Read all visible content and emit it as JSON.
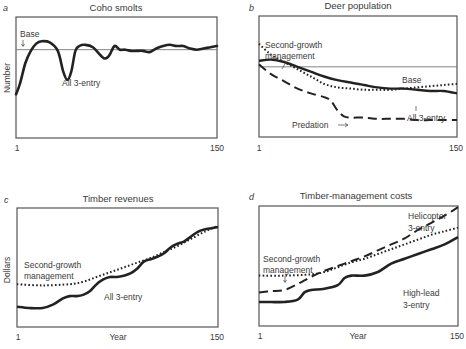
{
  "chart_data": [
    {
      "panel": "a",
      "type": "line",
      "title": "Coho smolts",
      "xlabel": "",
      "ylabel": "Number",
      "xlim": [
        1,
        150
      ],
      "x_ticks": [
        "1",
        "150"
      ],
      "frame": {
        "x0": 16,
        "y0": 17,
        "x1": 217,
        "y1": 138
      },
      "reference": {
        "name": "Base",
        "value": 73
      },
      "series": [
        {
          "name": "All 3-entry",
          "style": "solid",
          "x": [
            1,
            4,
            8,
            12,
            16,
            20,
            26,
            32,
            36,
            39,
            42,
            45,
            48,
            52,
            58,
            66,
            70,
            74,
            78,
            82,
            86,
            90,
            95,
            100,
            105,
            110,
            115,
            120,
            125,
            130,
            135,
            140,
            145,
            150
          ],
          "y": [
            36,
            45,
            62,
            72,
            78,
            80,
            79,
            72,
            55,
            48,
            55,
            72,
            76,
            77,
            75,
            66,
            68,
            76,
            73,
            73,
            72,
            72,
            72,
            71,
            74,
            76,
            77,
            76,
            76,
            74,
            73,
            74,
            75,
            76
          ]
        }
      ],
      "annotations": [
        {
          "text": "Base",
          "x": 18,
          "y": 37
        },
        {
          "text": "All 3-entry",
          "x": 62,
          "y": 85
        }
      ]
    },
    {
      "panel": "b",
      "type": "line",
      "title": "Deer population",
      "xlabel": "",
      "ylabel": "",
      "xlim": [
        1,
        150
      ],
      "x_ticks": [
        "1",
        "150"
      ],
      "frame": {
        "x0": 259,
        "y0": 16,
        "x1": 457,
        "y1": 137
      },
      "reference": {
        "name": "Base",
        "value": 58
      },
      "series": [
        {
          "name": "All 3-entry",
          "style": "solid",
          "x": [
            1,
            10,
            20,
            30,
            40,
            50,
            60,
            70,
            80,
            90,
            100,
            110,
            120,
            130,
            140,
            150
          ],
          "y": [
            63,
            64,
            62,
            58,
            54,
            50,
            47,
            45,
            43,
            41,
            40,
            40,
            39,
            38,
            38,
            36
          ]
        },
        {
          "name": "Second-growth management",
          "style": "dotted",
          "x": [
            1,
            10,
            20,
            30,
            40,
            50,
            60,
            70,
            80,
            90,
            100,
            110,
            120,
            130,
            140,
            150
          ],
          "y": [
            77,
            68,
            62,
            56,
            50,
            44,
            41,
            40,
            39,
            39,
            39,
            40,
            41,
            42,
            43,
            44
          ]
        },
        {
          "name": "Predation",
          "style": "dashed",
          "x": [
            1,
            10,
            20,
            30,
            40,
            50,
            55,
            60,
            65,
            70,
            80,
            90,
            100,
            110,
            120,
            130,
            140,
            150
          ],
          "y": [
            60,
            52,
            46,
            40,
            36,
            33,
            30,
            22,
            17,
            16,
            16,
            15,
            15,
            15,
            14,
            14,
            14,
            14
          ]
        }
      ],
      "annotations": [
        {
          "text": "Second-growth management",
          "x": 265,
          "y": 46
        },
        {
          "text": "Base",
          "x": 400,
          "y": 83
        },
        {
          "text": "All 3-entry",
          "x": 406,
          "y": 121
        },
        {
          "text": "Predation",
          "x": 292,
          "y": 127
        }
      ]
    },
    {
      "panel": "c",
      "type": "line",
      "title": "Timber revenues",
      "xlabel": "Year",
      "ylabel": "Dollars",
      "xlim": [
        1,
        150
      ],
      "x_ticks": [
        "1",
        "150"
      ],
      "frame": {
        "x0": 17,
        "y0": 208,
        "x1": 218,
        "y1": 327
      },
      "series": [
        {
          "name": "All 3-entry",
          "style": "solid",
          "x": [
            1,
            10,
            20,
            28,
            35,
            40,
            45,
            50,
            55,
            60,
            65,
            70,
            75,
            80,
            85,
            90,
            95,
            100,
            105,
            110,
            115,
            120,
            125,
            130,
            135,
            140,
            145,
            150
          ],
          "y": [
            17,
            16,
            16,
            19,
            24,
            26,
            26,
            27,
            30,
            36,
            40,
            42,
            42,
            43,
            45,
            49,
            55,
            57,
            59,
            62,
            67,
            70,
            72,
            76,
            80,
            82,
            83,
            84
          ]
        },
        {
          "name": "Second-growth management",
          "style": "dotted",
          "x": [
            1,
            20,
            40,
            50,
            60,
            70,
            80,
            90,
            100,
            110,
            120,
            130,
            140,
            150
          ],
          "y": [
            36,
            35,
            36,
            38,
            42,
            46,
            50,
            54,
            58,
            63,
            68,
            74,
            80,
            85
          ]
        }
      ],
      "annotations": [
        {
          "text": "Second-growth management",
          "x": 24,
          "y": 268
        },
        {
          "text": "All 3-entry",
          "x": 104,
          "y": 299
        }
      ]
    },
    {
      "panel": "d",
      "type": "line",
      "title": "Timber-management costs",
      "xlabel": "Year",
      "ylabel": "",
      "xlim": [
        1,
        150
      ],
      "x_ticks": [
        "1",
        "150"
      ],
      "frame": {
        "x0": 259,
        "y0": 206,
        "x1": 458,
        "y1": 326
      },
      "series": [
        {
          "name": "High-lead 3-entry",
          "style": "solid",
          "x": [
            1,
            10,
            20,
            30,
            35,
            40,
            50,
            60,
            65,
            70,
            80,
            90,
            100,
            110,
            120,
            130,
            140,
            150
          ],
          "y": [
            20,
            20,
            20,
            22,
            28,
            30,
            31,
            34,
            40,
            42,
            42,
            45,
            52,
            56,
            60,
            64,
            68,
            74
          ]
        },
        {
          "name": "Second-growth management",
          "style": "dotted",
          "x": [
            1,
            20,
            40,
            50,
            60,
            70,
            80,
            90,
            100,
            110,
            120,
            130,
            140,
            150
          ],
          "y": [
            42,
            42,
            43,
            45,
            49,
            53,
            56,
            60,
            64,
            68,
            72,
            76,
            79,
            82
          ]
        },
        {
          "name": "Helicopter 3-entry",
          "style": "dashed",
          "x": [
            1,
            10,
            20,
            30,
            40,
            50,
            60,
            70,
            80,
            90,
            100,
            110,
            120,
            130,
            140,
            150
          ],
          "y": [
            28,
            29,
            30,
            35,
            41,
            46,
            50,
            54,
            58,
            63,
            68,
            73,
            80,
            86,
            92,
            99
          ]
        }
      ],
      "annotations": [
        {
          "text": "Helicopter 3-entry",
          "x": 409,
          "y": 218
        },
        {
          "text": "Second-growth management",
          "x": 263,
          "y": 261
        },
        {
          "text": "High-lead 3-entry",
          "x": 403,
          "y": 296
        }
      ]
    }
  ],
  "panels": {
    "a": {
      "letter": "a",
      "title": "Coho smolts",
      "ylabel": "Number",
      "x_start": "1",
      "x_end": "150",
      "label_base": "Base",
      "label_all3": "All 3-entry"
    },
    "b": {
      "letter": "b",
      "title": "Deer population",
      "x_start": "1",
      "x_end": "150",
      "label_sg_1": "Second-growth",
      "label_sg_2": "management",
      "label_base": "Base",
      "label_all3": "All 3-entry",
      "label_predation": "Predation"
    },
    "c": {
      "letter": "c",
      "title": "Timber revenues",
      "ylabel": "Dollars",
      "xlabel": "Year",
      "x_start": "1",
      "x_end": "150",
      "label_sg_1": "Second-growth",
      "label_sg_2": "management",
      "label_all3": "All 3-entry"
    },
    "d": {
      "letter": "d",
      "title": "Timber-management costs",
      "xlabel": "Year",
      "x_start": "1",
      "x_end": "150",
      "label_heli_1": "Helicopter",
      "label_heli_2": "3-entry",
      "label_sg_1": "Second-growth",
      "label_sg_2": "management",
      "label_hl_1": "High-lead",
      "label_hl_2": "3-entry"
    }
  }
}
